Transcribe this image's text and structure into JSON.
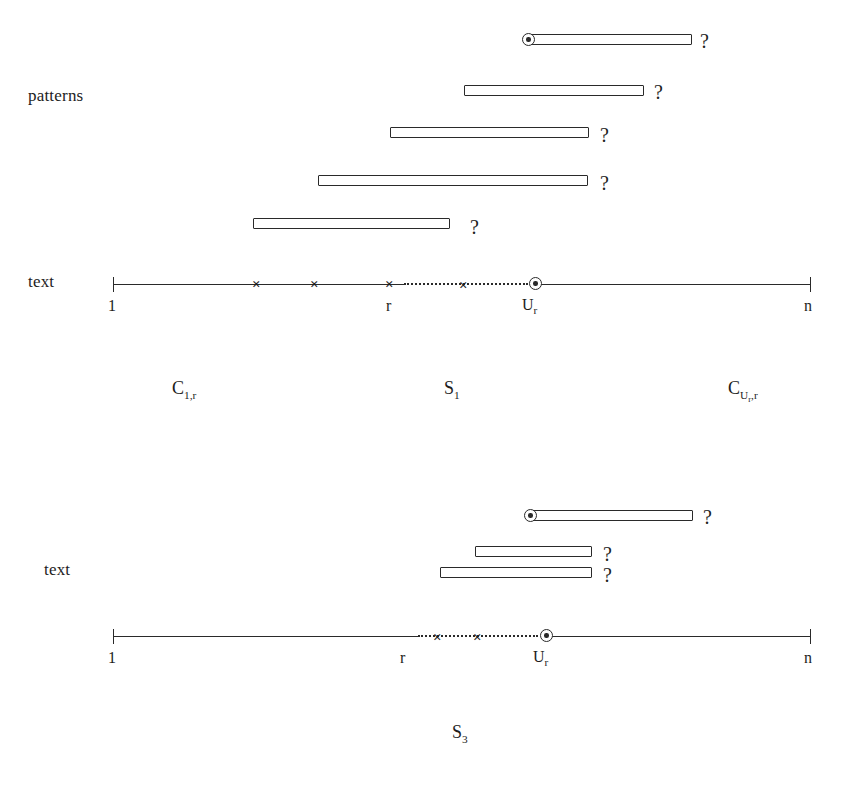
{
  "figure": {
    "kind": "string-matching-diagram",
    "caption": ""
  },
  "panels": [
    {
      "id": "panel-1",
      "left_labels": [
        {
          "name": "patterns",
          "text": "patterns",
          "x": 28,
          "y": 86
        },
        {
          "name": "text",
          "text": "text",
          "x": 28,
          "y": 272
        }
      ],
      "patterns": [
        {
          "index": 1,
          "x": 528,
          "y": 34,
          "width": 164,
          "marker": "circled-dot",
          "question": "?",
          "q_x": 700,
          "q_y": 30
        },
        {
          "index": 2,
          "x": 464,
          "y": 85,
          "width": 180,
          "marker": "none",
          "question": "?",
          "q_x": 654,
          "q_y": 81
        },
        {
          "index": 3,
          "x": 390,
          "y": 127,
          "width": 199,
          "marker": "none",
          "question": "?",
          "q_x": 600,
          "q_y": 124
        },
        {
          "index": 4,
          "x": 318,
          "y": 175,
          "width": 270,
          "marker": "none",
          "question": "?",
          "q_x": 600,
          "q_y": 172
        },
        {
          "index": 5,
          "x": 253,
          "y": 218,
          "width": 197,
          "marker": "none",
          "question": "?",
          "q_x": 470,
          "q_y": 216
        }
      ],
      "axis": {
        "y": 284,
        "start_x": 113,
        "end_x": 810,
        "solid_segments": [
          [
            113,
            404
          ],
          [
            537,
            810
          ]
        ],
        "dotted_segments": [
          [
            404,
            528
          ]
        ],
        "ticks": [
          {
            "name": "tick-start",
            "x": 113,
            "label": "1",
            "label_x": 108,
            "label_y": 297
          },
          {
            "name": "tick-end",
            "x": 810,
            "label": "n",
            "label_x": 804,
            "label_y": 297
          }
        ],
        "mid_labels": [
          {
            "name": "r",
            "text": "r",
            "x": 386,
            "y": 297
          },
          {
            "name": "u-r",
            "text": "U",
            "sub": "r",
            "x": 522,
            "y": 296
          }
        ],
        "x_marks": [
          257,
          315,
          390,
          464
        ],
        "circled_dot_x": 529
      },
      "set_labels": [
        {
          "name": "c-1-r",
          "base": "C",
          "sub": "1,r",
          "x": 172,
          "y": 378
        },
        {
          "name": "s-1",
          "base": "S",
          "sub": "1",
          "x": 444,
          "y": 378
        },
        {
          "name": "c-ur-r",
          "base": "C",
          "sub": "U",
          "sub2": "r",
          "sub3": ",r",
          "x": 728,
          "y": 378
        }
      ]
    },
    {
      "id": "panel-2",
      "left_labels": [
        {
          "name": "text",
          "text": "text",
          "x": 44,
          "y": 560
        }
      ],
      "patterns": [
        {
          "index": 1,
          "x": 530,
          "y": 510,
          "width": 163,
          "marker": "circled-dot",
          "question": "?",
          "q_x": 703,
          "q_y": 506
        },
        {
          "index": 2,
          "x": 475,
          "y": 546,
          "width": 117,
          "marker": "none",
          "question": "?",
          "q_x": 603,
          "q_y": 543
        },
        {
          "index": 3,
          "x": 440,
          "y": 567,
          "width": 152,
          "marker": "none",
          "question": "?",
          "q_x": 603,
          "q_y": 564
        }
      ],
      "axis": {
        "y": 636,
        "start_x": 113,
        "end_x": 810,
        "solid_segments": [
          [
            113,
            418
          ],
          [
            547,
            810
          ]
        ],
        "dotted_segments": [
          [
            418,
            538
          ]
        ],
        "ticks": [
          {
            "name": "tick-start",
            "x": 113,
            "label": "1",
            "label_x": 108,
            "label_y": 649
          },
          {
            "name": "tick-end",
            "x": 810,
            "label": "n",
            "label_x": 804,
            "label_y": 649
          }
        ],
        "mid_labels": [
          {
            "name": "r",
            "text": "r",
            "x": 400,
            "y": 649
          },
          {
            "name": "u-r",
            "text": "U",
            "sub": "r",
            "x": 533,
            "y": 648
          }
        ],
        "x_marks": [
          438,
          478
        ],
        "circled_dot_x": 540
      },
      "set_labels": [
        {
          "name": "s-3",
          "base": "S",
          "sub": "3",
          "x": 452,
          "y": 722
        }
      ]
    }
  ]
}
